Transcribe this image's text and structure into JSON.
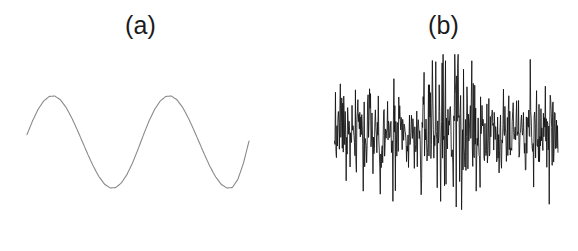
{
  "figure": {
    "background_color": "#ffffff",
    "width": 578,
    "height": 251,
    "panels": [
      {
        "id": "panel-a",
        "label": "(a)",
        "description": "clean sinusoidal signal",
        "line_color": "#8a8a8a"
      },
      {
        "id": "panel-b",
        "label": "(b)",
        "description": "noisy signal",
        "line_color": "#111111"
      }
    ]
  },
  "chart_data": [
    {
      "type": "line",
      "id": "panel-a-clean-sine",
      "title": "(a)",
      "xlabel": "",
      "ylabel": "",
      "grid": false,
      "legend": null,
      "axes_visible": false,
      "xlim": [
        0,
        2.2
      ],
      "ylim": [
        -1.15,
        1.15
      ],
      "series": [
        {
          "name": "clean sine",
          "color": "#8a8a8a",
          "description": "Two full cycles of a smooth sinusoid, amplitude 1, starting near zero on the rising edge.",
          "x": [
            0,
            0.05,
            0.1,
            0.15,
            0.2,
            0.25,
            0.3,
            0.35,
            0.4,
            0.45,
            0.5,
            0.55,
            0.6,
            0.65,
            0.7,
            0.75,
            0.8,
            0.85,
            0.9,
            0.95,
            1.0,
            1.05,
            1.1,
            1.15,
            1.2,
            1.25,
            1.3,
            1.35,
            1.4,
            1.45,
            1.5,
            1.55,
            1.6,
            1.65,
            1.7,
            1.75,
            1.8,
            1.85,
            1.9,
            1.95,
            2.0
          ],
          "y": [
            0.16,
            0.46,
            0.71,
            0.89,
            0.99,
            1.0,
            0.92,
            0.76,
            0.54,
            0.28,
            0.0,
            -0.28,
            -0.54,
            -0.76,
            -0.92,
            -1.0,
            -0.99,
            -0.89,
            -0.71,
            -0.46,
            -0.16,
            0.16,
            0.46,
            0.71,
            0.89,
            0.99,
            1.0,
            0.92,
            0.76,
            0.54,
            0.28,
            0.0,
            -0.28,
            -0.54,
            -0.76,
            -0.92,
            -1.0,
            -0.99,
            -0.81,
            -0.46,
            0.02
          ]
        }
      ]
    },
    {
      "type": "line",
      "id": "panel-b-noisy-signal",
      "title": "(b)",
      "xlabel": "",
      "ylabel": "",
      "grid": false,
      "legend": null,
      "axes_visible": false,
      "xlim": [
        0,
        2.2
      ],
      "ylim": [
        -1.9,
        1.9
      ],
      "series": [
        {
          "name": "noisy signal",
          "color": "#111111",
          "description": "High-frequency random noise with a broad amplitude envelope that swells near the center of the record.",
          "samples": 460,
          "noise_amplitude_range": [
            0.25,
            1.85
          ],
          "envelope_peak_x": 0.52,
          "y_min": -1.85,
          "y_max": 1.85
        }
      ]
    }
  ]
}
